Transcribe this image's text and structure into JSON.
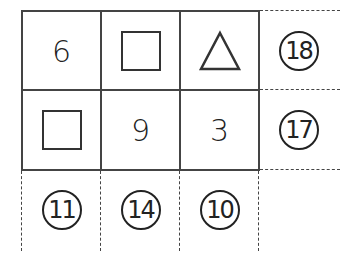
{
  "puzzle": {
    "grid": [
      [
        {
          "type": "number",
          "value": "6"
        },
        {
          "type": "square",
          "value": ""
        },
        {
          "type": "triangle",
          "value": ""
        }
      ],
      [
        {
          "type": "square",
          "value": ""
        },
        {
          "type": "number",
          "value": "9"
        },
        {
          "type": "number",
          "value": "3"
        }
      ]
    ],
    "row_sums": [
      "18",
      "17"
    ],
    "column_sums": [
      "11",
      "14",
      "10"
    ],
    "line_color": "#444444"
  }
}
